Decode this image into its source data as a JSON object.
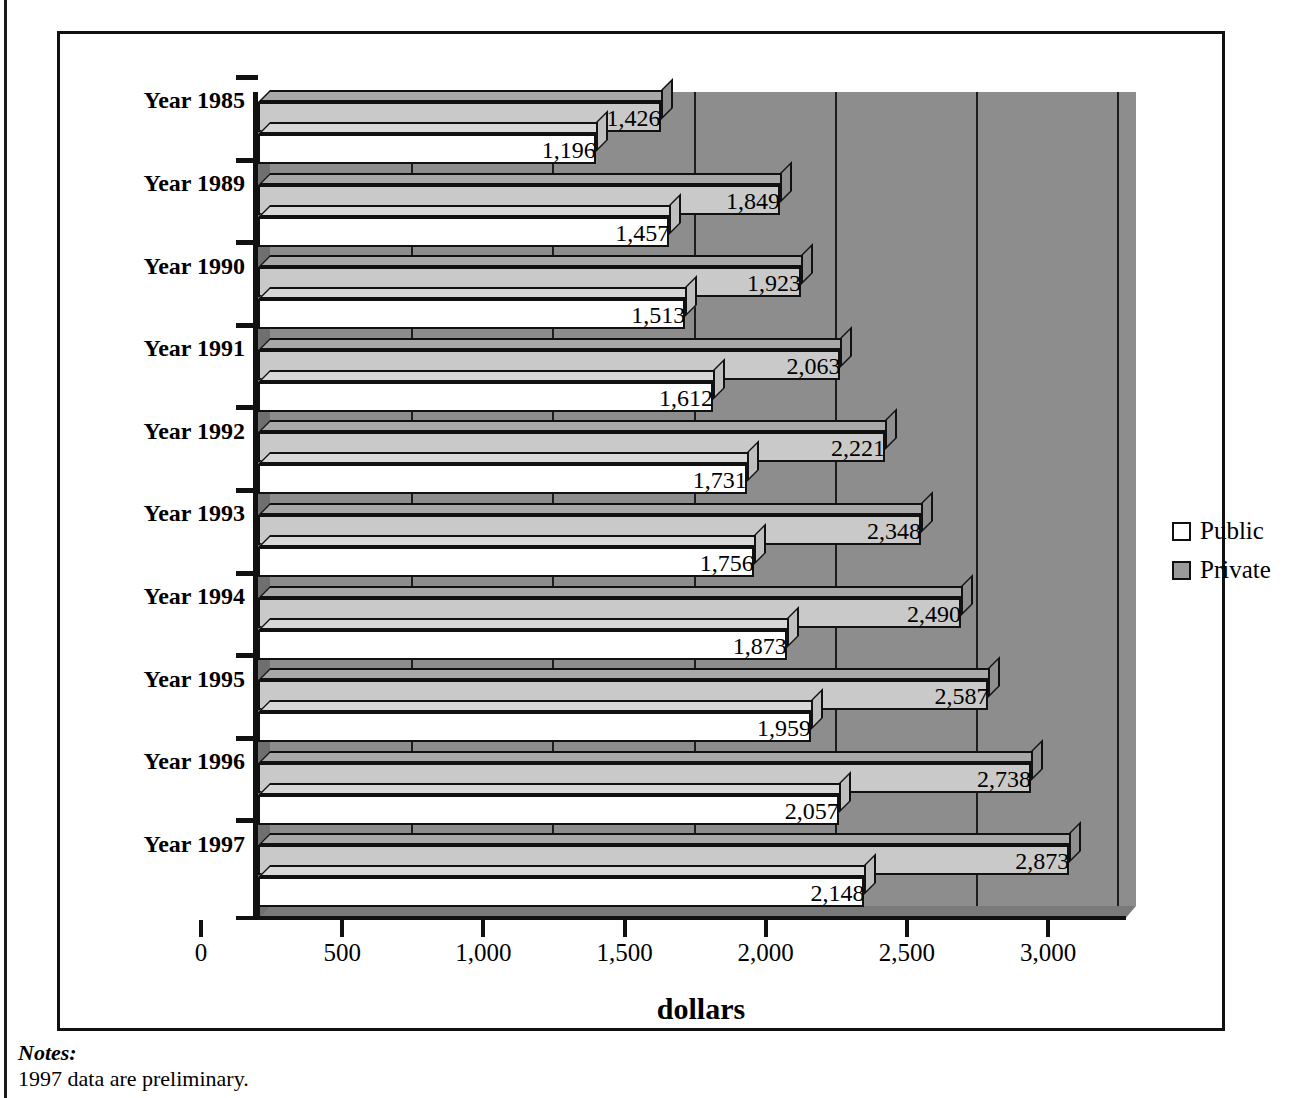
{
  "chart_data": {
    "type": "bar",
    "orientation": "horizontal",
    "title": "",
    "xlabel": "dollars",
    "ylabel": "",
    "xlim": [
      0,
      3000
    ],
    "xticks": [
      0,
      500,
      1000,
      1500,
      2000,
      2500,
      3000
    ],
    "xticklabels": [
      "0",
      "500",
      "1,000",
      "1,500",
      "2,000",
      "2,500",
      "3,000"
    ],
    "grid": true,
    "legend_position": "right",
    "categories": [
      "Year 1985",
      "Year 1989",
      "Year 1990",
      "Year 1991",
      "Year 1992",
      "Year 1993",
      "Year 1994",
      "Year 1995",
      "Year 1996",
      "Year 1997"
    ],
    "series": [
      {
        "name": "Public",
        "color": "#ffffff",
        "values": [
          1196,
          1457,
          1513,
          1612,
          1731,
          1756,
          1873,
          1959,
          2057,
          2148
        ],
        "labels": [
          "1,196",
          "1,457",
          "1,513",
          "1,612",
          "1,731",
          "1,756",
          "1,873",
          "1,959",
          "2,057",
          "2,148"
        ]
      },
      {
        "name": "Private",
        "color": "#c9c9c9",
        "values": [
          1426,
          1849,
          1923,
          2063,
          2221,
          2348,
          2490,
          2587,
          2738,
          2873
        ],
        "labels": [
          "1,426",
          "1,849",
          "1,923",
          "2,063",
          "2,221",
          "2,348",
          "2,490",
          "2,587",
          "2,738",
          "2,873"
        ]
      }
    ]
  },
  "legend": {
    "items": [
      {
        "label": "Public",
        "swatch": "legend-swatch-public"
      },
      {
        "label": "Private",
        "swatch": "legend-swatch-private"
      }
    ]
  },
  "axis_title": "dollars",
  "notes": {
    "heading": "Notes:",
    "body": "1997 data are preliminary."
  }
}
